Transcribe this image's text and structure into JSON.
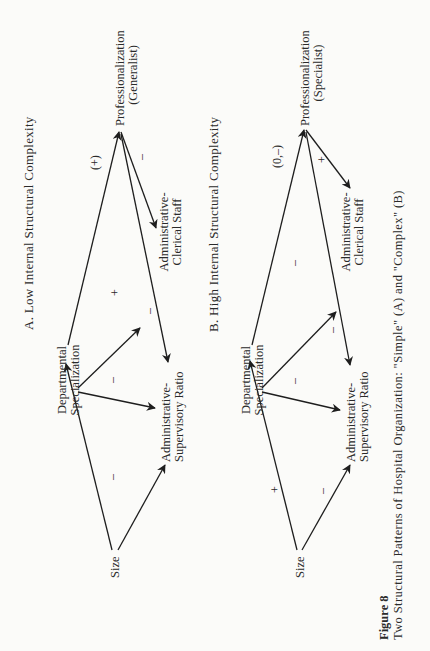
{
  "figure": {
    "number_label": "Figure 8",
    "caption": "Two Structural Patterns of Hospital Organization: \"Simple\" (A) and \"Complex\" (B)",
    "orientation": "rotated 90° counter-clockwise"
  },
  "panels": [
    {
      "id": "A",
      "title": "A. Low Internal Structural Complexity",
      "nodes": {
        "size": "Size",
        "dept_line1": "Departmental",
        "dept_line2": "Specialization",
        "asr_line1": "Administrative-",
        "asr_line2": "Supervisory Ratio",
        "acs_line1": "Administrative-",
        "acs_line2": "Clerical Staff",
        "prof_line1": "Professionalization",
        "prof_line2": "(Generalist)"
      },
      "edges": [
        {
          "from": "Size",
          "to": "Departmental Specialization",
          "sign": ""
        },
        {
          "from": "Size",
          "to": "Administrative-Supervisory Ratio",
          "sign": "–"
        },
        {
          "from": "Departmental Specialization",
          "to": "Administrative-Supervisory Ratio",
          "sign": "–"
        },
        {
          "from": "Departmental Specialization",
          "to": "Administrative-Clerical Staff",
          "sign": "+"
        },
        {
          "from": "Departmental Specialization",
          "to": "Professionalization",
          "sign": "(+)"
        },
        {
          "from": "Professionalization",
          "to": "Administrative-Clerical Staff",
          "sign": "–"
        },
        {
          "from": "Professionalization",
          "to": "Administrative-Supervisory Ratio",
          "sign": "–"
        }
      ],
      "signs": {
        "size_asr": "–",
        "dept_asr": "–",
        "dept_acs": "+",
        "dept_prof": "(+)",
        "prof_acs": "–",
        "prof_asr": "–"
      }
    },
    {
      "id": "B",
      "title": "B. High Internal Structural Complexity",
      "nodes": {
        "size": "Size",
        "dept_line1": "Departmental",
        "dept_line2": "Specialization",
        "asr_line1": "Administrative-",
        "asr_line2": "Supervisory Ratio",
        "acs_line1": "Administrative-",
        "acs_line2": "Clerical Staff",
        "prof_line1": "Professionalization",
        "prof_line2": "(Specialist)"
      },
      "edges": [
        {
          "from": "Size",
          "to": "Departmental Specialization",
          "sign": "+"
        },
        {
          "from": "Size",
          "to": "Administrative-Supervisory Ratio",
          "sign": "–"
        },
        {
          "from": "Departmental Specialization",
          "to": "Administrative-Supervisory Ratio",
          "sign": "–"
        },
        {
          "from": "Departmental Specialization",
          "to": "Administrative-Clerical Staff",
          "sign": "–"
        },
        {
          "from": "Departmental Specialization",
          "to": "Professionalization",
          "sign": "(0,–)"
        },
        {
          "from": "Professionalization",
          "to": "Administrative-Clerical Staff",
          "sign": "+"
        },
        {
          "from": "Professionalization",
          "to": "Administrative-Supervisory Ratio",
          "sign": "–"
        }
      ],
      "signs": {
        "size_dept": "+",
        "size_asr": "–",
        "dept_asr": "–",
        "dept_acs": "–",
        "dept_prof": "(0,–)",
        "prof_acs": "+",
        "prof_asr": "–"
      }
    }
  ]
}
